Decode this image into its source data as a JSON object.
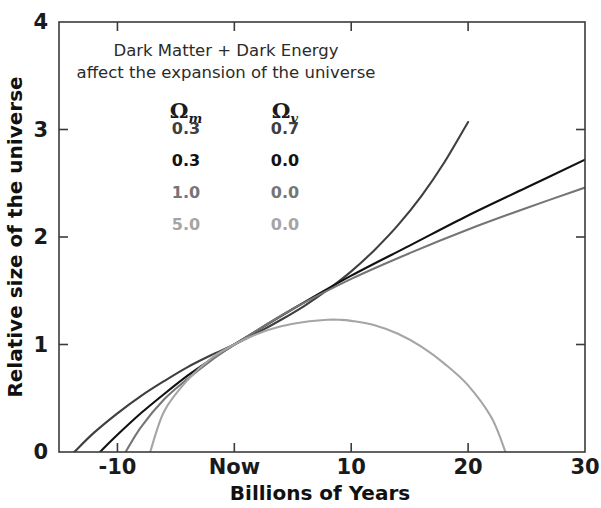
{
  "chart_data": {
    "type": "line",
    "title": "",
    "xlabel": "Billions of Years",
    "ylabel": "Relative size of the universe",
    "xlim": [
      -15,
      30
    ],
    "ylim": [
      0,
      4
    ],
    "grid": false,
    "legend_position": "upper-left-inside",
    "xticks": [
      {
        "value": -10,
        "label": "-10"
      },
      {
        "value": 0,
        "label": "Now"
      },
      {
        "value": 10,
        "label": "10"
      },
      {
        "value": 20,
        "label": "20"
      },
      {
        "value": 30,
        "label": "30"
      }
    ],
    "yticks": [
      {
        "value": 0,
        "label": "0"
      },
      {
        "value": 1,
        "label": "1"
      },
      {
        "value": 2,
        "label": "2"
      },
      {
        "value": 3,
        "label": "3"
      },
      {
        "value": 4,
        "label": "4"
      }
    ],
    "annotations": [
      "Dark Matter + Dark Energy",
      "affect the expansion of the universe"
    ],
    "legend_columns": [
      "Ω",
      "Ω"
    ],
    "legend_column_subscripts": [
      "m",
      "v"
    ],
    "series": [
      {
        "name": "Om=0.3, Ov=0.7",
        "omega_m": "0.3",
        "omega_v": "0.7",
        "color": "#3f3f3f",
        "description": "accelerating universe with dark energy",
        "x": [
          -13.7,
          -12,
          -10,
          -8,
          -6,
          -4,
          -2,
          0,
          2,
          4,
          6,
          8,
          10,
          12,
          14,
          16,
          18,
          20
        ],
        "y": [
          0.0,
          0.18,
          0.36,
          0.52,
          0.66,
          0.79,
          0.9,
          1.0,
          1.11,
          1.23,
          1.36,
          1.51,
          1.68,
          1.88,
          2.11,
          2.38,
          2.7,
          3.07
        ]
      },
      {
        "name": "Om=0.3, Ov=0.0",
        "omega_m": "0.3",
        "omega_v": "0.0",
        "color": "#111111",
        "description": "open universe, coasting expansion",
        "x": [
          -11.5,
          -10,
          -8,
          -6,
          -4,
          -2,
          0,
          5,
          10,
          15,
          20,
          25,
          30
        ],
        "y": [
          0.0,
          0.16,
          0.36,
          0.54,
          0.71,
          0.86,
          1.0,
          1.33,
          1.64,
          1.92,
          2.2,
          2.46,
          2.72
        ]
      },
      {
        "name": "Om=1.0, Ov=0.0",
        "omega_m": "1.0",
        "omega_v": "0.0",
        "color": "#757575",
        "description": "flat critical-density universe",
        "x": [
          -9.3,
          -8,
          -6,
          -4,
          -2,
          0,
          5,
          10,
          15,
          20,
          25,
          30
        ],
        "y": [
          0.0,
          0.23,
          0.49,
          0.68,
          0.85,
          1.0,
          1.33,
          1.61,
          1.85,
          2.07,
          2.27,
          2.46
        ]
      },
      {
        "name": "Om=5.0, Ov=0.0",
        "omega_m": "5.0",
        "omega_v": "0.0",
        "color": "#a5a5a5",
        "description": "closed universe, expands then recollapses",
        "x": [
          -7.2,
          -6,
          -4,
          -2,
          0,
          2,
          4,
          6,
          8,
          9,
          10,
          12,
          14,
          16,
          18,
          20,
          22,
          23.2
        ],
        "y": [
          0.0,
          0.38,
          0.67,
          0.87,
          1.0,
          1.1,
          1.17,
          1.21,
          1.23,
          1.23,
          1.22,
          1.18,
          1.1,
          0.98,
          0.82,
          0.62,
          0.32,
          0.0
        ]
      }
    ]
  },
  "legend": {
    "line1": "Dark Matter + Dark Energy",
    "line2": "affect the expansion of the universe",
    "col1_symbol": "Ω",
    "col1_sub": "m",
    "col2_symbol": "Ω",
    "col2_sub": "v",
    "rows": [
      {
        "m": "0.3",
        "v": "0.7",
        "color": "#3f3f3f"
      },
      {
        "m": "0.3",
        "v": "0.0",
        "color": "#111111"
      },
      {
        "m": "1.0",
        "v": "0.0",
        "color": "#757575"
      },
      {
        "m": "5.0",
        "v": "0.0",
        "color": "#a5a5a5"
      }
    ]
  },
  "axes": {
    "x_title": "Billions of Years",
    "y_title": "Relative size of the universe",
    "x_tick_labels": [
      "-10",
      "Now",
      "10",
      "20",
      "30"
    ],
    "y_tick_labels": [
      "0",
      "1",
      "2",
      "3",
      "4"
    ]
  },
  "colors": {
    "frame": "#3b3b3b",
    "text": "#1a1a1a",
    "background": "#ffffff"
  }
}
